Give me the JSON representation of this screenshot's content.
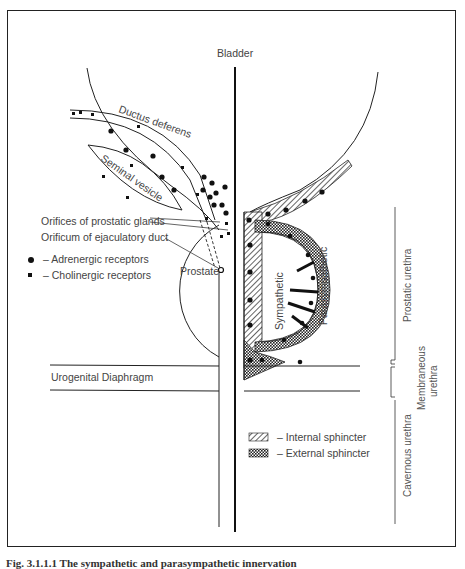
{
  "figure": {
    "caption": "Fig. 3.1.1.1 The sympathetic and parasympathetic innervation",
    "colors": {
      "line": "#1a1a1a",
      "text": "#444444",
      "background": "#ffffff"
    }
  },
  "labels": {
    "bladder": "Bladder",
    "ductus_deferens": "Ductus deferens",
    "seminal_vesicle": "Seminal vesicle",
    "orifices_prostatic_glands": "Orifices of prostatic glands",
    "orificum_ejaculatory_duct": "Orificum of ejaculatory duct",
    "prostate": "Prostate",
    "sympathetic": "Sympathetic",
    "parasympathetic": "Parasympathetic",
    "urogenital_diaphragm": "Urogenital Diaphragm",
    "prostatic_urethra": "Prostatic urethra",
    "membraneous_urethra_1": "Membraneous",
    "membraneous_urethra_2": "urethra",
    "cavernous_urethra": "Cavernous urethra"
  },
  "legend_receptors": [
    {
      "symbol": "circle",
      "label": "– Adrenergic receptors"
    },
    {
      "symbol": "square",
      "label": "– Cholinergic receptors"
    }
  ],
  "legend_sphincters": [
    {
      "pattern": "hatch",
      "label": "– Internal sphincter"
    },
    {
      "pattern": "crosshatch",
      "label": "– External sphincter"
    }
  ]
}
